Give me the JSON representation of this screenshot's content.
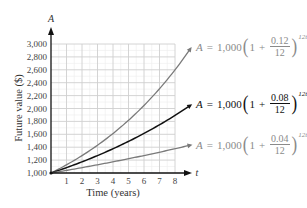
{
  "chart_data": {
    "type": "line",
    "title": "",
    "xlabel": "Time (years)",
    "ylabel": "Future value ($)",
    "x_axis_var": "t",
    "y_axis_var": "A",
    "xlim": [
      0,
      8
    ],
    "ylim": [
      1000,
      3000
    ],
    "x_ticks": [
      1,
      2,
      3,
      4,
      5,
      6,
      7,
      8
    ],
    "y_ticks": [
      "1,000",
      "1,200",
      "1,400",
      "1,600",
      "1,800",
      "2,000",
      "2,200",
      "2,400",
      "2,600",
      "2,800",
      "3,000"
    ],
    "grid": true,
    "x": [
      0,
      1,
      2,
      3,
      4,
      5,
      6,
      7,
      8,
      9
    ],
    "series": [
      {
        "name": "A = 1,000(1 + 0.12/12)^12t",
        "rate": 0.12,
        "color": "#7a7a7a",
        "values": [
          1000,
          1127,
          1270,
          1431,
          1612,
          1817,
          2047,
          2307,
          2599,
          2929
        ]
      },
      {
        "name": "A = 1,000(1 + 0.08/12)^12t",
        "rate": 0.08,
        "color": "#111111",
        "values": [
          1000,
          1083,
          1173,
          1270,
          1376,
          1490,
          1614,
          1748,
          1893,
          2050
        ]
      },
      {
        "name": "A = 1,000(1 + 0.04/12)^12t",
        "rate": 0.04,
        "color": "#7a7a7a",
        "values": [
          1000,
          1041,
          1083,
          1127,
          1173,
          1221,
          1271,
          1323,
          1376,
          1433
        ]
      }
    ]
  },
  "labels": {
    "y_var": "A",
    "x_var": "t",
    "xlabel": "Time (years)",
    "ylabel": "Future value ($)"
  },
  "equations": [
    {
      "A": "A",
      "eq": "=",
      "principal": "1,000",
      "one": "1",
      "plus": "+",
      "num": "0.12",
      "den": "12",
      "exp": "12t"
    },
    {
      "A": "A",
      "eq": "=",
      "principal": "1,000",
      "one": "1",
      "plus": "+",
      "num": "0.08",
      "den": "12",
      "exp": "12t"
    },
    {
      "A": "A",
      "eq": "=",
      "principal": "1,000",
      "one": "1",
      "plus": "+",
      "num": "0.04",
      "den": "12",
      "exp": "12t"
    }
  ]
}
